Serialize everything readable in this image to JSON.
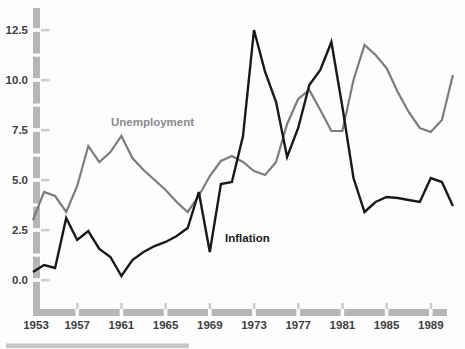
{
  "figure": {
    "kind": "time-series line chart (scanned textbook figure)",
    "series_labels": {
      "unemployment": "Unemployment",
      "inflation": "Inflation"
    }
  },
  "colors": {
    "background": "#fdfdfd",
    "axis_bar": "#b6b6b6",
    "axis_tick": "#cdcdcd",
    "tick_label_text": "#3f3f3f",
    "unemployment_line": "#7c7c7c",
    "unemployment_label_text": "#8a8a8a",
    "inflation_line": "#191919",
    "inflation_label_text": "#1a1a1a",
    "page_rule": "#c6c6c6"
  },
  "chart_data": {
    "type": "line",
    "x": [
      1953,
      1954,
      1955,
      1956,
      1957,
      1958,
      1959,
      1960,
      1961,
      1962,
      1963,
      1964,
      1965,
      1966,
      1967,
      1968,
      1969,
      1970,
      1971,
      1972,
      1973,
      1974,
      1975,
      1976,
      1977,
      1978,
      1979,
      1980,
      1981,
      1982,
      1983,
      1984,
      1985,
      1986,
      1987,
      1988,
      1989,
      1990,
      1991
    ],
    "series": [
      {
        "name": "Unemployment",
        "color": "#7c7c7c",
        "values": [
          3.0,
          4.4,
          4.2,
          3.4,
          4.7,
          6.7,
          5.9,
          6.4,
          7.2,
          6.1,
          5.5,
          5.0,
          4.5,
          3.9,
          3.4,
          4.2,
          5.2,
          5.95,
          6.2,
          5.9,
          5.45,
          5.25,
          5.9,
          7.8,
          9.05,
          9.5,
          8.5,
          7.45,
          7.45,
          10.0,
          11.75,
          11.25,
          10.6,
          9.4,
          8.4,
          7.6,
          7.4,
          8.0,
          10.25
        ]
      },
      {
        "name": "Inflation",
        "color": "#191919",
        "values": [
          0.4,
          0.75,
          0.6,
          3.1,
          2.0,
          2.45,
          1.55,
          1.15,
          0.2,
          1.0,
          1.4,
          1.7,
          1.9,
          2.2,
          2.6,
          4.4,
          1.4,
          4.8,
          4.9,
          7.2,
          12.5,
          10.4,
          8.9,
          6.15,
          7.6,
          9.75,
          10.5,
          11.9,
          8.65,
          5.1,
          3.4,
          3.9,
          4.15,
          4.1,
          4.0,
          3.9,
          5.1,
          4.9,
          3.7
        ]
      }
    ],
    "title": "",
    "xlabel": "",
    "ylabel": "",
    "ylim": [
      0,
      13.6
    ],
    "xlim": [
      1953,
      1991
    ],
    "yticks": [
      0.0,
      2.5,
      5.0,
      7.5,
      10.0,
      12.5
    ],
    "ytick_labels": [
      "0.0",
      "2.5",
      "5.0",
      "7.5",
      "10.0",
      "12.5"
    ],
    "xticks": [
      1953,
      1957,
      1961,
      1965,
      1969,
      1973,
      1977,
      1981,
      1985,
      1989
    ],
    "xtick_labels": [
      "1953",
      "1957",
      "1961",
      "1965",
      "1969",
      "1973",
      "1977",
      "1981",
      "1985",
      "1989"
    ],
    "grid": false,
    "legend_position": "inline-annotations",
    "annotations": [
      {
        "text": "Unemployment",
        "x_px": 111,
        "y_px": 117
      },
      {
        "text": "Inflation",
        "x_px": 225,
        "y_px": 233
      }
    ]
  }
}
